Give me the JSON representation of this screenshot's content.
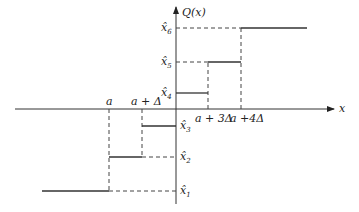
{
  "diagram": {
    "y_axis_label": "Q(x)",
    "x_axis_label": "x",
    "x_tick_labels": [
      {
        "text": "a",
        "x": 109
      },
      {
        "text": "a + Δ",
        "x": 142
      },
      {
        "text": "a + 3Δ",
        "x": 208
      },
      {
        "text": "a +4Δ",
        "x": 241
      }
    ],
    "levels": [
      {
        "name": "x̂",
        "sub": "1",
        "y": 191
      },
      {
        "name": "x̂",
        "sub": "2",
        "y": 157
      },
      {
        "name": "x̂",
        "sub": "3",
        "y": 126
      },
      {
        "name": "x̂",
        "sub": "4",
        "y": 93
      },
      {
        "name": "x̂",
        "sub": "5",
        "y": 62
      },
      {
        "name": "x̂",
        "sub": "6",
        "y": 28
      }
    ]
  }
}
